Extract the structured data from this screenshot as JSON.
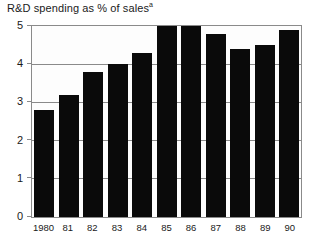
{
  "chart_data": {
    "type": "bar",
    "title": "R&D spending as % of sales",
    "title_superscript": "a",
    "xlabel": "",
    "ylabel": "",
    "categories": [
      "1980",
      "81",
      "82",
      "83",
      "84",
      "85",
      "86",
      "87",
      "88",
      "89",
      "90"
    ],
    "values": [
      2.8,
      3.2,
      3.8,
      4.0,
      4.3,
      5.0,
      5.0,
      4.8,
      4.4,
      4.5,
      4.9
    ],
    "ylim": [
      0,
      5
    ],
    "y_ticks": [
      0,
      1,
      2,
      3,
      4,
      5
    ],
    "y_tick_labels": [
      "0",
      "1",
      "2",
      "3",
      "4",
      "5"
    ],
    "grid": true,
    "legend": null,
    "bar_color": "#0a0a0a",
    "axis_color": "#8a8a8a",
    "background_color": "#fdfdfd"
  }
}
